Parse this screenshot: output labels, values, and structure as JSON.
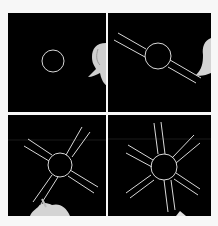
{
  "figure": {
    "background": "#f7f7f7",
    "panels": [
      {
        "id": 1,
        "description": "Circle drawn on black background, hand at right edge",
        "spokes": 0
      },
      {
        "id": 2,
        "description": "Circle with one pair of parallel lines diagonal",
        "spokes": 1
      },
      {
        "id": 3,
        "description": "Circle with two crossing pairs of parallel lines",
        "spokes": 2
      },
      {
        "id": 4,
        "description": "Circle with three pairs of parallel lines forming star",
        "spokes": 3
      }
    ],
    "line_color": "#d8d8d8",
    "panel_color": "#000000"
  }
}
